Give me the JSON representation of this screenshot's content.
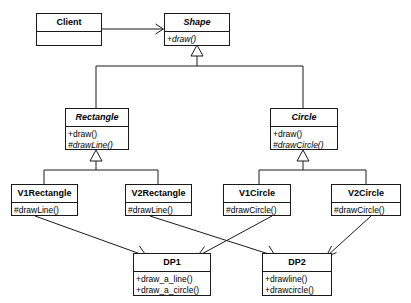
{
  "diagram": {
    "kind": "uml-class-diagram",
    "line_color": "#1a1a1a",
    "background": "#ffffff",
    "classes": [
      {
        "id": "client",
        "name": "Client",
        "abstract": false,
        "operations": []
      },
      {
        "id": "shape",
        "name": "Shape",
        "abstract": true,
        "operations": [
          "+draw()"
        ]
      },
      {
        "id": "rectangle",
        "name": "Rectangle",
        "abstract": true,
        "operations": [
          "+draw()",
          "#drawLine()"
        ]
      },
      {
        "id": "circle",
        "name": "Circle",
        "abstract": true,
        "operations": [
          "+draw()",
          "#drawCircle()"
        ]
      },
      {
        "id": "v1rectangle",
        "name": "V1Rectangle",
        "abstract": false,
        "operations": [
          "#drawLine()"
        ]
      },
      {
        "id": "v2rectangle",
        "name": "V2Rectangle",
        "abstract": false,
        "operations": [
          "#drawLine()"
        ]
      },
      {
        "id": "v1circle",
        "name": "V1Circle",
        "abstract": false,
        "operations": [
          "#drawCircle()"
        ]
      },
      {
        "id": "v2circle",
        "name": "V2Circle",
        "abstract": false,
        "operations": [
          "#drawCircle()"
        ]
      },
      {
        "id": "dp1",
        "name": "DP1",
        "abstract": false,
        "operations": [
          "+draw_a_line()",
          "+draw_a_circle()"
        ]
      },
      {
        "id": "dp2",
        "name": "DP2",
        "abstract": false,
        "operations": [
          "+drawline()",
          "+drawcircle()"
        ]
      }
    ],
    "relationships": [
      {
        "from": "client",
        "to": "shape",
        "type": "association"
      },
      {
        "from": "rectangle",
        "to": "shape",
        "type": "generalization"
      },
      {
        "from": "circle",
        "to": "shape",
        "type": "generalization"
      },
      {
        "from": "v1rectangle",
        "to": "rectangle",
        "type": "generalization"
      },
      {
        "from": "v2rectangle",
        "to": "rectangle",
        "type": "generalization"
      },
      {
        "from": "v1circle",
        "to": "circle",
        "type": "generalization"
      },
      {
        "from": "v2circle",
        "to": "circle",
        "type": "generalization"
      },
      {
        "from": "v1rectangle",
        "to": "dp1",
        "type": "dependency"
      },
      {
        "from": "v2rectangle",
        "to": "dp2",
        "type": "dependency"
      },
      {
        "from": "v1circle",
        "to": "dp1",
        "type": "dependency"
      },
      {
        "from": "v2circle",
        "to": "dp2",
        "type": "dependency"
      }
    ]
  }
}
